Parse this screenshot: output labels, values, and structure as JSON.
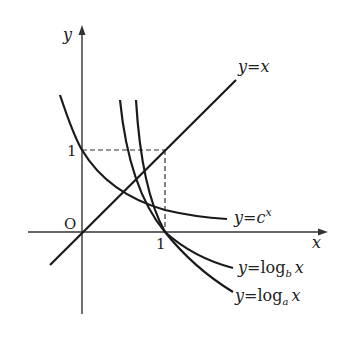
{
  "diagram": {
    "axes": {
      "x_label": "x",
      "y_label": "y",
      "origin_label": "O",
      "x_tick_label": "1",
      "y_tick_label": "1"
    },
    "curves": [
      {
        "id": "line-y-eq-x",
        "label_prefix": "y=",
        "label_main": "x",
        "label_sub": "",
        "label_sup": ""
      },
      {
        "id": "exp-c",
        "label_prefix": "y=",
        "label_main": "c",
        "label_sub": "",
        "label_sup": "x"
      },
      {
        "id": "log-b",
        "label_prefix": "y=",
        "label_main": "log",
        "label_sub": "b",
        "label_sup": "",
        "label_arg": "x"
      },
      {
        "id": "log-a",
        "label_prefix": "y=",
        "label_main": "log",
        "label_sub": "a",
        "label_sup": "",
        "label_arg": "x"
      }
    ],
    "guides": {
      "dashed_box": "from (0,1) to (1,1) to (1,0)"
    }
  }
}
